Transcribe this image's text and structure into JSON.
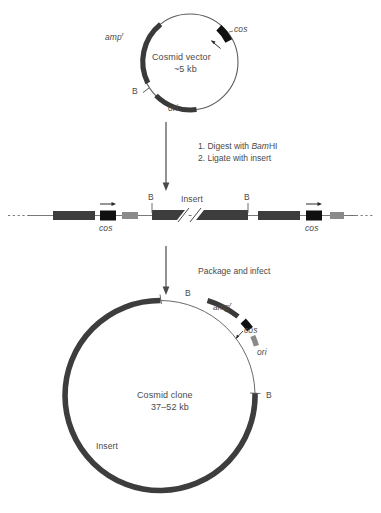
{
  "figure": {
    "colors": {
      "backbone_dark": "#3d3d3d",
      "segment_dark": "#3a3a3a",
      "segment_gray": "#8a8a8a",
      "thin_line": "#5a5a5a",
      "text": "#4a4a4a",
      "cos_black": "#111111"
    },
    "panels": {
      "top": {
        "name": "cosmid-vector-circle",
        "center_label_line1": "Cosmid vector",
        "center_label_line2": "~5 kb",
        "labels": {
          "amp": "amp",
          "amp_super": "r",
          "cos": "cos",
          "bamhi": "B",
          "ori": "ori"
        }
      },
      "step1": {
        "name": "digest-ligate-steps",
        "line1_prefix": "1. Digest with ",
        "line1_italic": "Bam",
        "line1_suffix": "HI",
        "line2": "2. Ligate with insert"
      },
      "middle": {
        "name": "linear-dna-concatemer",
        "labels": {
          "cos_left": "cos",
          "cos_right": "cos",
          "b_left": "B",
          "b_right": "B",
          "insert": "Insert"
        }
      },
      "step2": {
        "name": "package-and-infect-step",
        "text": "Package and infect"
      },
      "bottom": {
        "name": "cosmid-clone-circle",
        "center_label_line1": "Cosmid clone",
        "center_label_line2": "37–52 kb",
        "labels": {
          "b_top": "B",
          "b_right": "B",
          "amp": "amp",
          "amp_super": "r",
          "cos": "cos",
          "ori": "ori",
          "insert": "Insert"
        }
      }
    }
  }
}
